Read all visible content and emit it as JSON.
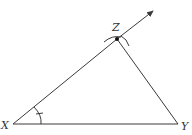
{
  "diagram": {
    "type": "geometric-construction",
    "colors": {
      "stroke": "#3a3a3a",
      "text": "#333333",
      "background": "#ffffff"
    },
    "points": {
      "X": {
        "label": "X",
        "x": 13,
        "y": 124
      },
      "Y": {
        "label": "Y",
        "x": 178,
        "y": 124
      },
      "Z": {
        "label": "Z",
        "x": 117,
        "y": 39
      }
    },
    "segments": [
      {
        "from": "X",
        "to": "Y"
      },
      {
        "from": "X",
        "to": "Z"
      },
      {
        "from": "Z",
        "to": "Y"
      }
    ],
    "ray": {
      "from": "Z",
      "direction": "extension of XZ",
      "arrow": true
    },
    "marks": {
      "angle_arc_at_X": true,
      "angle_tick_at_X": true,
      "construction_arcs_at_Z": 2
    }
  }
}
